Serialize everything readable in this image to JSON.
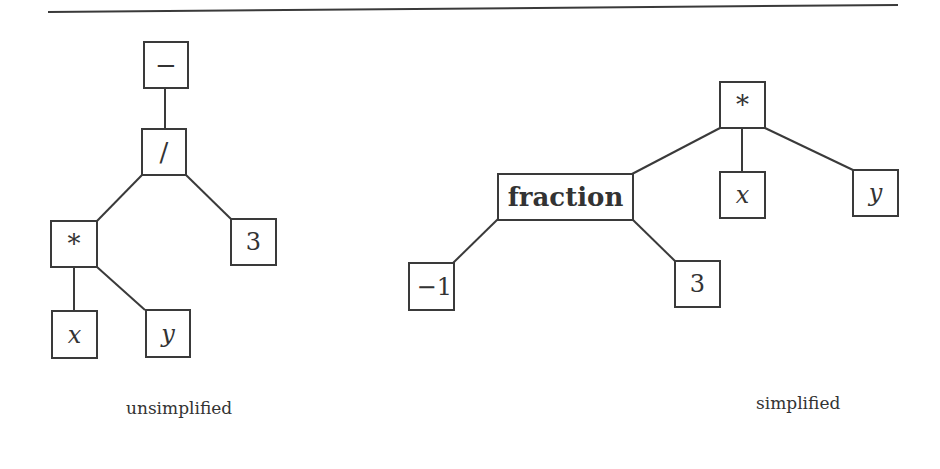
{
  "rule": {
    "x1": 48,
    "y1": 12,
    "x2": 898,
    "y2": 5,
    "color": "#3a3a3a"
  },
  "trees": {
    "unsimplified": {
      "caption": "unsimplified",
      "nodes": [
        {
          "id": "u-minus",
          "label": "−",
          "kind": "op"
        },
        {
          "id": "u-div",
          "label": "/",
          "kind": "op"
        },
        {
          "id": "u-mul",
          "label": "*",
          "kind": "op"
        },
        {
          "id": "u-3",
          "label": "3",
          "kind": "num"
        },
        {
          "id": "u-x",
          "label": "x",
          "kind": "var"
        },
        {
          "id": "u-y",
          "label": "y",
          "kind": "var"
        }
      ],
      "edges": [
        [
          "u-minus",
          "u-div"
        ],
        [
          "u-div",
          "u-mul"
        ],
        [
          "u-div",
          "u-3"
        ],
        [
          "u-mul",
          "u-x"
        ],
        [
          "u-mul",
          "u-y"
        ]
      ]
    },
    "simplified": {
      "caption": "simplified",
      "nodes": [
        {
          "id": "s-mul",
          "label": "*",
          "kind": "op"
        },
        {
          "id": "s-fraction",
          "label": "fraction",
          "kind": "bold"
        },
        {
          "id": "s-x",
          "label": "x",
          "kind": "var"
        },
        {
          "id": "s-y",
          "label": "y",
          "kind": "var"
        },
        {
          "id": "s-neg1",
          "label": "−1",
          "kind": "num"
        },
        {
          "id": "s-3",
          "label": "3",
          "kind": "num"
        }
      ],
      "edges": [
        [
          "s-mul",
          "s-fraction"
        ],
        [
          "s-mul",
          "s-x"
        ],
        [
          "s-mul",
          "s-y"
        ],
        [
          "s-fraction",
          "s-neg1"
        ],
        [
          "s-fraction",
          "s-3"
        ]
      ]
    }
  }
}
